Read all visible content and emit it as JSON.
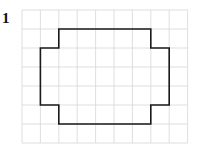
{
  "problem_number": "1",
  "grid": {
    "cols": 9,
    "rows": 7,
    "origin_x": 22,
    "origin_y": 10,
    "cell_w": 18.4,
    "cell_h": 19,
    "line_color": "#d6d6d6"
  },
  "shape": {
    "stroke_color": "#1a1a1a",
    "stroke_width": 1.6,
    "vertices": [
      [
        2,
        1
      ],
      [
        7,
        1
      ],
      [
        7,
        2
      ],
      [
        8,
        2
      ],
      [
        8,
        5
      ],
      [
        7,
        5
      ],
      [
        7,
        6
      ],
      [
        2,
        6
      ],
      [
        2,
        5
      ],
      [
        1,
        5
      ],
      [
        1,
        2
      ],
      [
        2,
        2
      ]
    ]
  }
}
